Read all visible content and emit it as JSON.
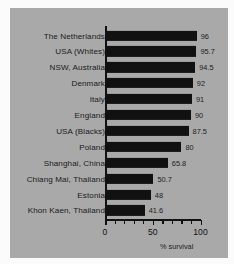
{
  "chart_data": {
    "type": "bar",
    "orientation": "horizontal",
    "title": "",
    "xlabel": "% survival",
    "ylabel": "",
    "xlim": [
      0,
      100
    ],
    "grid": false,
    "legend": null,
    "tick_labels": [
      "0",
      "50",
      "100"
    ],
    "tick_values": [
      0,
      50,
      100
    ],
    "minor_tick_values": [
      10,
      20,
      30,
      40,
      60,
      70,
      80,
      90
    ],
    "bar_color": "#111111",
    "background_color": "#a9a9a9",
    "categories": [
      "The Netherlands",
      "USA (Whites)",
      "NSW, Australia",
      "Denmark",
      "Italy",
      "England",
      "USA (Blacks)",
      "Poland",
      "Shanghai, China",
      "Chiang Mai, Thailand",
      "Estonia",
      "Khon Kaen, Thailand"
    ],
    "values": [
      96,
      95.7,
      94.5,
      92,
      91,
      90,
      87.5,
      80,
      65.8,
      50.7,
      48,
      41.6
    ],
    "value_labels": [
      "96",
      "95.7",
      "94.5",
      "92",
      "91",
      "90",
      "87.5",
      "80",
      "65.8",
      "50.7",
      "48",
      "41.6"
    ]
  }
}
